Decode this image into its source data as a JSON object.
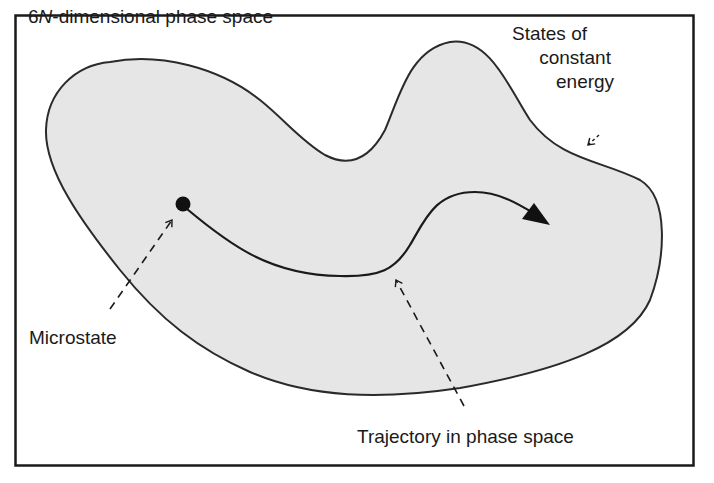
{
  "diagram": {
    "title": {
      "prefix": "6",
      "italic": "N",
      "suffix": "-dimensional phase space"
    },
    "labels": {
      "energy_line1": "States of",
      "energy_line2": "constant",
      "energy_line3": "energy",
      "microstate": "Microstate",
      "trajectory": "Trajectory in phase space"
    },
    "colors": {
      "frame": "#1a1a1a",
      "region_fill": "#e6e6e6",
      "region_stroke": "#2a2a2a",
      "trajectory": "#1a1a1a",
      "point": "#111111",
      "background": "#ffffff"
    },
    "elements": {
      "frame": "6N-dimensional phase space boundary box",
      "region": "constant-energy surface region",
      "microstate_point": "microstate dot",
      "trajectory_path": "trajectory curve with arrowhead",
      "pointers": [
        "energy pointer arrow",
        "microstate pointer arrow (dashed)",
        "trajectory pointer arrow (dashed)"
      ]
    }
  }
}
